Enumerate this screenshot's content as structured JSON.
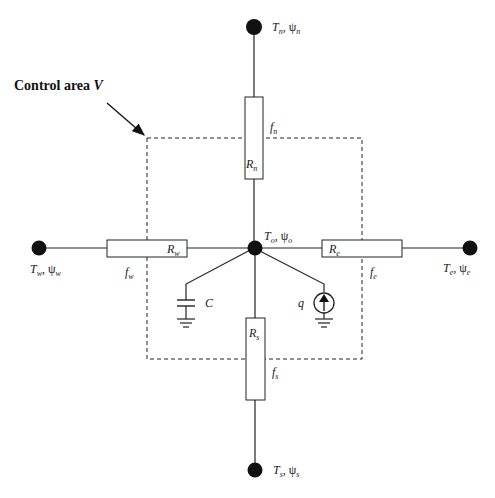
{
  "title": {
    "text": "Control area ",
    "var": "V"
  },
  "nodes": {
    "center": {
      "T": "T",
      "T_sub": "o",
      "psi": "ψ",
      "psi_sub": "o"
    },
    "north": {
      "T": "T",
      "T_sub": "n",
      "psi": "ψ",
      "psi_sub": "n"
    },
    "south": {
      "T": "T",
      "T_sub": "s",
      "psi": "ψ",
      "psi_sub": "s"
    },
    "west": {
      "T": "T",
      "T_sub": "w",
      "psi": "ψ",
      "psi_sub": "w"
    },
    "east": {
      "T": "T",
      "T_sub": "e",
      "psi": "ψ",
      "psi_sub": "e"
    }
  },
  "resistors": {
    "north": {
      "R": "R",
      "sub": "n"
    },
    "south": {
      "R": "R",
      "sub": "s"
    },
    "west": {
      "R": "R",
      "sub": "w"
    },
    "east": {
      "R": "R",
      "sub": "e"
    }
  },
  "faces": {
    "north": {
      "f": "f",
      "sub": "n"
    },
    "south": {
      "f": "f",
      "sub": "s"
    },
    "west": {
      "f": "f",
      "sub": "w"
    },
    "east": {
      "f": "f",
      "sub": "e"
    }
  },
  "capacitor": {
    "label": "C"
  },
  "source": {
    "label": "q"
  }
}
